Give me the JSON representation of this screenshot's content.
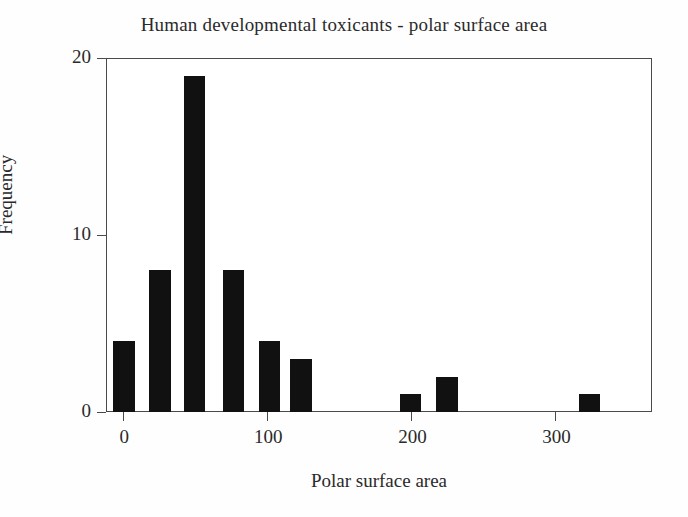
{
  "chart_data": {
    "type": "bar",
    "title": "Human developmental toxicants - polar surface area",
    "xlabel": "Polar surface area",
    "ylabel": "Frequency",
    "xlim": [
      -12,
      367
    ],
    "ylim": [
      0,
      20
    ],
    "xticks": [
      0,
      100,
      200,
      300
    ],
    "xtick_labels": [
      "0",
      "100",
      "200",
      "300"
    ],
    "yticks": [
      0,
      10,
      20
    ],
    "ytick_labels": [
      "0",
      "10",
      "20"
    ],
    "grid": false,
    "legend": null,
    "bar_color": "#111111",
    "bin_width": 25,
    "categories": [
      0,
      25,
      50,
      75,
      100,
      125,
      150,
      175,
      200,
      225,
      250,
      275,
      300,
      325
    ],
    "values": [
      4,
      8,
      19,
      8,
      4,
      3,
      0,
      0,
      1,
      2,
      0,
      0,
      0,
      1
    ],
    "bars": [
      {
        "bin_start": -7,
        "bin_end": 8,
        "center": 0,
        "value": 4
      },
      {
        "bin_start": 18,
        "bin_end": 33,
        "center": 25,
        "value": 8
      },
      {
        "bin_start": 42,
        "bin_end": 57,
        "center": 50,
        "value": 19
      },
      {
        "bin_start": 69,
        "bin_end": 84,
        "center": 76,
        "value": 8
      },
      {
        "bin_start": 94,
        "bin_end": 109,
        "center": 101,
        "value": 4
      },
      {
        "bin_start": 116,
        "bin_end": 131,
        "center": 123,
        "value": 3
      },
      {
        "bin_start": 192,
        "bin_end": 207,
        "center": 199,
        "value": 1
      },
      {
        "bin_start": 217,
        "bin_end": 232,
        "center": 224,
        "value": 2
      },
      {
        "bin_start": 316,
        "bin_end": 331,
        "center": 323,
        "value": 1
      }
    ]
  }
}
